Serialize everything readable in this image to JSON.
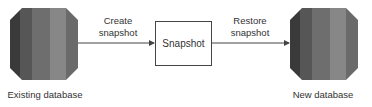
{
  "diagram": {
    "nodes": [
      {
        "id": "existing",
        "label": "Existing database",
        "shape": "database"
      },
      {
        "id": "snapshot",
        "label": "Snapshot",
        "shape": "box"
      },
      {
        "id": "new",
        "label": "New database",
        "shape": "database"
      }
    ],
    "edges": [
      {
        "from": "existing",
        "to": "snapshot",
        "label_line1": "Create",
        "label_line2": "snapshot"
      },
      {
        "from": "snapshot",
        "to": "new",
        "label_line1": "Restore",
        "label_line2": "snapshot"
      }
    ],
    "colors": {
      "stripe_1": "#3a3a3a",
      "stripe_2": "#555555",
      "stripe_3": "#6e6e6e",
      "stripe_4": "#888888",
      "stripe_5": "#6a6a6a",
      "line": "#444444"
    }
  }
}
